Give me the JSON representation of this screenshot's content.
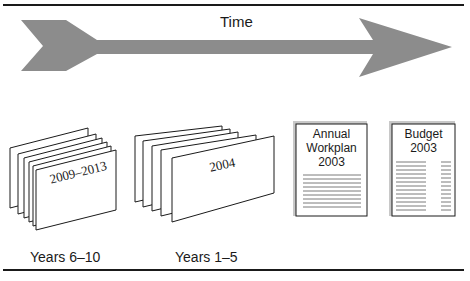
{
  "timeline": {
    "label": "Time",
    "arrow_color": "#8c8c8c"
  },
  "stacks": [
    {
      "card_label": "2009–2013",
      "card_count": 6,
      "caption": "Years 6–10"
    },
    {
      "card_label": "2004",
      "card_count": 5,
      "caption": "Years 1–5"
    }
  ],
  "documents": [
    {
      "title_lines": [
        "Annual",
        "Workplan",
        "2003"
      ],
      "type": "text-lines"
    },
    {
      "title_lines": [
        "Budget",
        "2003"
      ],
      "type": "two-column-lines"
    }
  ],
  "colors": {
    "ink": "#1a1a1a",
    "arrow": "#8c8c8c",
    "page_shadow": "#bdbdbd",
    "page_lines": "#7a7a7a"
  }
}
